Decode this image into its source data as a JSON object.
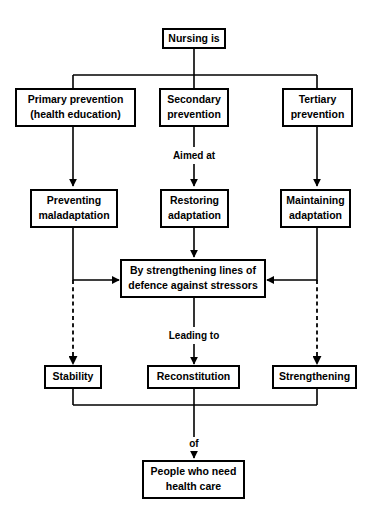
{
  "diagram": {
    "title": "Nursing is",
    "nodes": [
      {
        "id": "nursing_is",
        "lines": [
          "Nursing is"
        ]
      },
      {
        "id": "primary",
        "lines": [
          "Primary prevention",
          "(health education)"
        ]
      },
      {
        "id": "secondary",
        "lines": [
          "Secondary",
          "prevention"
        ]
      },
      {
        "id": "tertiary",
        "lines": [
          "Tertiary",
          "prevention"
        ]
      },
      {
        "id": "preventing",
        "lines": [
          "Preventing",
          "maladaptation"
        ]
      },
      {
        "id": "restoring",
        "lines": [
          "Restoring",
          "adaptation"
        ]
      },
      {
        "id": "maintaining",
        "lines": [
          "Maintaining",
          "adaptation"
        ]
      },
      {
        "id": "strengthening_lines",
        "lines": [
          "By strengthening lines of",
          "defence against stressors"
        ]
      },
      {
        "id": "stability",
        "lines": [
          "Stability"
        ]
      },
      {
        "id": "reconstitution",
        "lines": [
          "Reconstitution"
        ]
      },
      {
        "id": "strengthening",
        "lines": [
          "Strengthening"
        ]
      },
      {
        "id": "people",
        "lines": [
          "People who need",
          "health care"
        ]
      }
    ],
    "edge_labels": [
      {
        "id": "aimed_at",
        "text": "Aimed at"
      },
      {
        "id": "leading_to",
        "text": "Leading to"
      },
      {
        "id": "of",
        "text": "of"
      }
    ],
    "colors": {
      "stroke": "#000000",
      "fill": "#ffffff",
      "text": "#000000"
    }
  }
}
